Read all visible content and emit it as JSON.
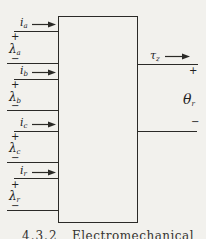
{
  "figure": {
    "type": "block-diagram",
    "caption": {
      "number": "4.3.2",
      "title": "Electromechanical"
    }
  },
  "colors": {
    "background": "#f2f1ed",
    "ink": "#2b2a27"
  },
  "left_ports": [
    {
      "current_symbol": "i",
      "current_subscript": "a",
      "plus_sign": "+",
      "flux_symbol": "λ",
      "flux_subscript": "a",
      "minus_sign": "−"
    },
    {
      "current_symbol": "i",
      "current_subscript": "b",
      "plus_sign": "+",
      "flux_symbol": "λ",
      "flux_subscript": "b",
      "minus_sign": "−"
    },
    {
      "current_symbol": "i",
      "current_subscript": "c",
      "plus_sign": "+",
      "flux_symbol": "λ",
      "flux_subscript": "c",
      "minus_sign": "−"
    },
    {
      "current_symbol": "i",
      "current_subscript": "r",
      "plus_sign": "+",
      "flux_symbol": "λ",
      "flux_subscript": "r",
      "minus_sign": "−"
    }
  ],
  "right_outputs": {
    "torque_symbol": "τ",
    "torque_subscript": "z",
    "torque_plus": "+",
    "angle_symbol": "θ",
    "angle_subscript": "r",
    "angle_minus": "−"
  }
}
